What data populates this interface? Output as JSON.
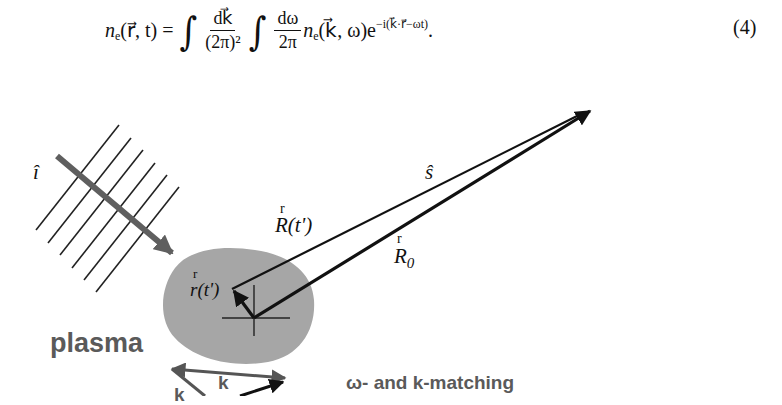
{
  "equation": {
    "lhs_symbol": "n",
    "lhs_sub": "e",
    "lhs_args": "(r⃗, t) =",
    "frac1_num": "dk⃗",
    "frac1_den": "(2π)²",
    "frac2_num": "dω",
    "frac2_den": "2π",
    "integrand_symbol": "n",
    "integrand_sub": "e",
    "integrand_args": "(k⃗, ω)e",
    "exponent": "−i(k⃗·r⃗−ωt)",
    "trailing": ".",
    "number": "(4)"
  },
  "figure": {
    "incident_label": "î",
    "scatter_dir_label": "ŝ",
    "R_t_label": "R(t')",
    "R0_label": "R",
    "R0_sub": "0",
    "r_t_label": "r(t')",
    "vector_mark": "r",
    "plasma_label": "plasma",
    "k_label": "k",
    "k_label_2": "k",
    "matching_label": "ω- and k-matching",
    "colors": {
      "plasma_fill": "#a6a6a6",
      "incident_arrow": "#5f5f5f",
      "lines": "#111111",
      "text_gray": "#5a5a5a"
    }
  }
}
